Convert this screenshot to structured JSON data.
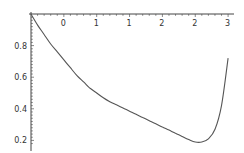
{
  "chart_data": {
    "type": "line",
    "title": "",
    "xlabel": "",
    "ylabel": "",
    "xlim": [
      0,
      3.05
    ],
    "ylim": [
      0.17,
      1.0
    ],
    "grid": false,
    "legend": null,
    "x_tick_labels": [
      "0",
      "1",
      "1",
      "2",
      "2",
      "3"
    ],
    "x_tick_values": [
      0.5,
      1.0,
      1.5,
      2.0,
      2.5,
      3.0
    ],
    "y_tick_labels": [
      "0.8",
      "0.6",
      "0.4",
      "0.2"
    ],
    "y_tick_values": [
      0.8,
      0.6,
      0.4,
      0.2
    ],
    "series": [
      {
        "name": "curve",
        "color": "#555555",
        "x": [
          0.0,
          0.1,
          0.2,
          0.3,
          0.4,
          0.5,
          0.6,
          0.7,
          0.8,
          0.9,
          1.0,
          1.1,
          1.2,
          1.3,
          1.4,
          1.5,
          1.6,
          1.7,
          1.8,
          1.9,
          2.0,
          2.1,
          2.2,
          2.3,
          2.4,
          2.5,
          2.6,
          2.7,
          2.8,
          2.9,
          3.0
        ],
        "y": [
          1.0,
          0.93,
          0.87,
          0.81,
          0.76,
          0.71,
          0.66,
          0.61,
          0.57,
          0.53,
          0.5,
          0.47,
          0.445,
          0.425,
          0.405,
          0.385,
          0.365,
          0.345,
          0.325,
          0.305,
          0.285,
          0.265,
          0.245,
          0.225,
          0.205,
          0.19,
          0.19,
          0.21,
          0.27,
          0.42,
          0.72
        ]
      }
    ]
  }
}
